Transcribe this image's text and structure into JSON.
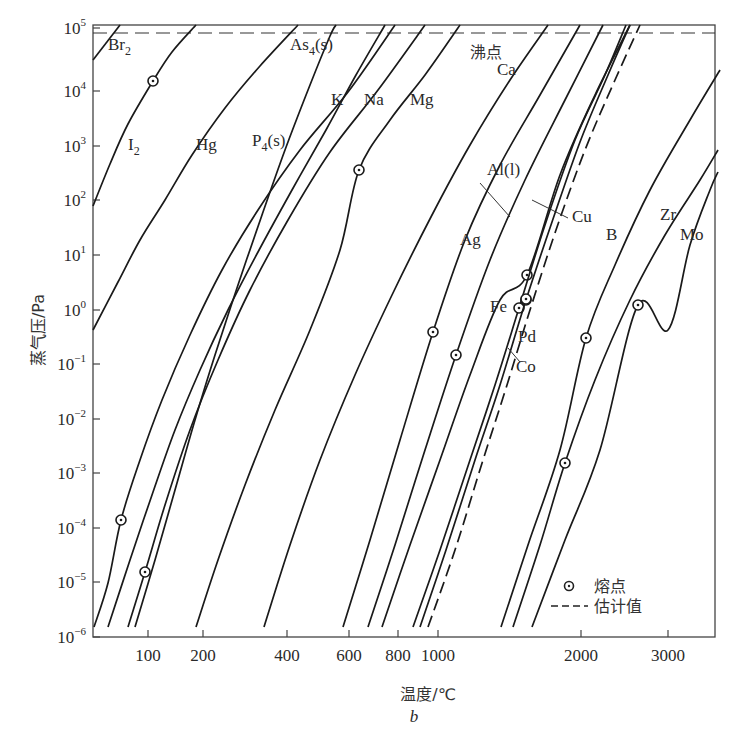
{
  "chart_data": {
    "type": "line",
    "title": "",
    "subtitle": "b",
    "xlabel": "温度/℃",
    "ylabel": "蒸气压/Pa",
    "x_scale": "reciprocal-temperature (1/T)",
    "y_scale": "log10",
    "ylim": [
      1e-06,
      100000.0
    ],
    "xlim_celsius": [
      30,
      3500
    ],
    "grid": false,
    "legend_position": "lower-right inside",
    "x_ticks": [
      {
        "label": "100",
        "value": 100,
        "px": 148
      },
      {
        "label": "200",
        "value": 200,
        "px": 203
      },
      {
        "label": "400",
        "value": 400,
        "px": 287
      },
      {
        "label": "600",
        "value": 600,
        "px": 349
      },
      {
        "label": "800",
        "value": 800,
        "px": 398
      },
      {
        "label": "1000",
        "value": 1000,
        "px": 438
      },
      {
        "label": "2000",
        "value": 2000,
        "px": 581
      },
      {
        "label": "3000",
        "value": 3000,
        "px": 668
      }
    ],
    "y_ticks": [
      {
        "base": "10",
        "exp": "5",
        "value": 100000,
        "px": 28
      },
      {
        "base": "10",
        "exp": "4",
        "value": 10000,
        "px": 91
      },
      {
        "base": "10",
        "exp": "3",
        "value": 1000,
        "px": 146
      },
      {
        "base": "10",
        "exp": "2",
        "value": 100,
        "px": 200
      },
      {
        "base": "10",
        "exp": "1",
        "value": 10,
        "px": 255
      },
      {
        "base": "10",
        "exp": "0",
        "value": 1,
        "px": 310
      },
      {
        "base": "10",
        "exp": "−1",
        "value": 0.1,
        "px": 364
      },
      {
        "base": "10",
        "exp": "−2",
        "value": 0.01,
        "px": 419
      },
      {
        "base": "10",
        "exp": "−3",
        "value": 0.001,
        "px": 473
      },
      {
        "base": "10",
        "exp": "−4",
        "value": 0.0001,
        "px": 528
      },
      {
        "base": "10",
        "exp": "−5",
        "value": 1e-05,
        "px": 582
      },
      {
        "base": "10",
        "exp": "−6",
        "value": 1e-06,
        "px": 637
      }
    ],
    "reference_lines": [
      {
        "name": "沸点",
        "meaning": "boiling point (1 atm)",
        "value_pa": 101325,
        "style": "dashed",
        "px_y": 33
      }
    ],
    "legend": [
      {
        "symbol": "circle-dot",
        "label": "熔点"
      },
      {
        "symbol": "dashed-line",
        "label": "估计值"
      }
    ],
    "series": [
      {
        "name": "Br₂",
        "label_display": "Br",
        "sub": "2",
        "style": "solid",
        "points": [
          [
            93,
            60
          ],
          [
            120,
            25
          ]
        ],
        "label_xy": [
          108,
          50
        ]
      },
      {
        "name": "I₂",
        "label_display": "I",
        "sub": "2",
        "style": "solid",
        "melting_point_px": [
          153,
          81
        ],
        "points": [
          [
            93,
            206
          ],
          [
            110,
            164
          ],
          [
            128,
            124
          ],
          [
            153,
            81
          ],
          [
            172,
            52
          ],
          [
            196,
            25
          ]
        ],
        "label_xy": [
          128,
          150
        ]
      },
      {
        "name": "Hg",
        "label_display": "Hg",
        "sub": "",
        "style": "solid",
        "points": [
          [
            93,
            330
          ],
          [
            118,
            282
          ],
          [
            140,
            240
          ],
          [
            165,
            200
          ],
          [
            192,
            155
          ],
          [
            225,
            108
          ],
          [
            260,
            66
          ],
          [
            298,
            25
          ]
        ],
        "label_xy": [
          196,
          150
        ]
      },
      {
        "name": "P₄(s)",
        "label_display": "P",
        "sub": "4",
        "suffix": "(s)",
        "style": "solid",
        "points": [
          [
            108,
            627
          ],
          [
            130,
            560
          ],
          [
            152,
            495
          ],
          [
            175,
            430
          ],
          [
            200,
            370
          ],
          [
            228,
            310
          ],
          [
            258,
            252
          ],
          [
            292,
            190
          ],
          [
            326,
            130
          ],
          [
            356,
            75
          ],
          [
            385,
            25
          ]
        ],
        "label_xy": [
          252,
          146
        ]
      },
      {
        "name": "As₄(s)",
        "label_display": "As",
        "sub": "4",
        "suffix": "(s)",
        "style": "solid",
        "points": [
          [
            135,
            627
          ],
          [
            155,
            560
          ],
          [
            175,
            490
          ],
          [
            195,
            420
          ],
          [
            215,
            355
          ],
          [
            238,
            285
          ],
          [
            262,
            215
          ],
          [
            285,
            150
          ],
          [
            310,
            85
          ],
          [
            330,
            36
          ],
          [
            336,
            25
          ]
        ],
        "label_xy": [
          290,
          50
        ]
      },
      {
        "name": "K",
        "label_display": "K",
        "sub": "",
        "style": "solid",
        "melting_point_px": [
          121,
          520
        ],
        "points": [
          [
            94,
            627
          ],
          [
            108,
            583
          ],
          [
            121,
            520
          ],
          [
            140,
            460
          ],
          [
            162,
            400
          ],
          [
            190,
            335
          ],
          [
            222,
            270
          ],
          [
            258,
            210
          ],
          [
            300,
            150
          ],
          [
            348,
            92
          ],
          [
            395,
            25
          ]
        ],
        "label_xy": [
          331,
          105
        ]
      },
      {
        "name": "Na",
        "label_display": "Na",
        "sub": "",
        "style": "solid",
        "melting_point_px": [
          145,
          572
        ],
        "points": [
          [
            128,
            627
          ],
          [
            145,
            572
          ],
          [
            165,
            505
          ],
          [
            190,
            430
          ],
          [
            218,
            360
          ],
          [
            250,
            290
          ],
          [
            288,
            220
          ],
          [
            330,
            152
          ],
          [
            378,
            90
          ],
          [
            425,
            25
          ]
        ],
        "label_xy": [
          364,
          105
        ]
      },
      {
        "name": "Mg",
        "label_display": "Mg",
        "sub": "",
        "style": "solid",
        "melting_point_px": [
          359,
          170
        ],
        "points": [
          [
            196,
            627
          ],
          [
            218,
            560
          ],
          [
            245,
            485
          ],
          [
            275,
            410
          ],
          [
            310,
            330
          ],
          [
            340,
            250
          ],
          [
            359,
            170
          ],
          [
            390,
            120
          ],
          [
            425,
            75
          ],
          [
            460,
            25
          ]
        ],
        "label_xy": [
          410,
          105
        ]
      },
      {
        "name": "Ca",
        "label_display": "Ca",
        "sub": "",
        "style": "solid",
        "points": [
          [
            264,
            627
          ],
          [
            290,
            545
          ],
          [
            320,
            460
          ],
          [
            355,
            375
          ],
          [
            392,
            295
          ],
          [
            432,
            215
          ],
          [
            470,
            145
          ],
          [
            510,
            80
          ],
          [
            548,
            25
          ]
        ],
        "label_xy": [
          497,
          75
        ]
      },
      {
        "name": "Ag",
        "label_display": "Ag",
        "sub": "",
        "style": "solid",
        "melting_point_px": [
          433,
          332
        ],
        "points": [
          [
            343,
            627
          ],
          [
            370,
            540
          ],
          [
            400,
            440
          ],
          [
            433,
            332
          ],
          [
            465,
            240
          ],
          [
            500,
            165
          ],
          [
            540,
            95
          ],
          [
            580,
            25
          ]
        ],
        "label_xy": [
          460,
          245
        ]
      },
      {
        "name": "Al(l)",
        "label_display": "Al(l)",
        "sub": "",
        "style": "solid",
        "melting_point_px": [
          456,
          355
        ],
        "points": [
          [
            368,
            627
          ],
          [
            395,
            545
          ],
          [
            425,
            450
          ],
          [
            456,
            355
          ],
          [
            490,
            260
          ],
          [
            525,
            180
          ],
          [
            565,
            100
          ],
          [
            603,
            25
          ]
        ],
        "label_xy": [
          487,
          175
        ],
        "leader": [
          [
            480,
            183
          ],
          [
            510,
            217
          ]
        ]
      },
      {
        "name": "Cu",
        "label_display": "Cu",
        "sub": "",
        "style": "solid",
        "melting_point_px": [
          527,
          275
        ],
        "points": [
          [
            382,
            627
          ],
          [
            410,
            545
          ],
          [
            440,
            460
          ],
          [
            470,
            375
          ],
          [
            500,
            300
          ],
          [
            527,
            275
          ],
          [
            560,
            175
          ],
          [
            595,
            95
          ],
          [
            630,
            25
          ]
        ],
        "label_xy": [
          572,
          222
        ],
        "leader": [
          [
            532,
            200
          ],
          [
            568,
            218
          ]
        ]
      },
      {
        "name": "Fe",
        "label_display": "Fe",
        "sub": "",
        "style": "solid",
        "melting_point_px": [
          519,
          308
        ],
        "points": [
          [
            413,
            627
          ],
          [
            440,
            550
          ],
          [
            470,
            460
          ],
          [
            495,
            385
          ],
          [
            519,
            308
          ],
          [
            545,
            225
          ],
          [
            575,
            140
          ],
          [
            605,
            75
          ],
          [
            626,
            25
          ]
        ],
        "label_xy": [
          490,
          312
        ]
      },
      {
        "name": "Pd",
        "label_display": "Pd",
        "sub": "",
        "style": "solid",
        "melting_point_px": [
          526,
          300
        ],
        "points": [
          [
            420,
            627
          ],
          [
            446,
            550
          ],
          [
            475,
            460
          ],
          [
            500,
            385
          ],
          [
            526,
            300
          ],
          [
            552,
            222
          ],
          [
            580,
            142
          ],
          [
            608,
            75
          ],
          [
            630,
            25
          ]
        ],
        "label_xy": [
          518,
          342
        ]
      },
      {
        "name": "Co",
        "label_display": "Co",
        "sub": "",
        "style": "dashed",
        "melting_point_px": [
          526,
          299
        ],
        "points": [
          [
            428,
            627
          ],
          [
            455,
            550
          ],
          [
            483,
            460
          ],
          [
            507,
            385
          ],
          [
            530,
            310
          ],
          [
            556,
            230
          ],
          [
            585,
            150
          ],
          [
            615,
            80
          ],
          [
            640,
            25
          ]
        ],
        "label_xy": [
          516,
          372
        ],
        "leader": [
          [
            508,
            348
          ],
          [
            520,
            362
          ]
        ]
      },
      {
        "name": "B",
        "label_display": "B",
        "sub": "",
        "style": "solid",
        "melting_point_px": [
          586,
          338
        ],
        "points": [
          [
            501,
            627
          ],
          [
            528,
            545
          ],
          [
            560,
            450
          ],
          [
            586,
            338
          ],
          [
            615,
            265
          ],
          [
            650,
            190
          ],
          [
            690,
            120
          ],
          [
            720,
            70
          ]
        ],
        "label_xy": [
          606,
          240
        ]
      },
      {
        "name": "Zr",
        "label_display": "Zr",
        "sub": "",
        "style": "solid",
        "melting_point_px": [
          565,
          463
        ],
        "points": [
          [
            513,
            627
          ],
          [
            540,
            545
          ],
          [
            565,
            463
          ],
          [
            595,
            380
          ],
          [
            630,
            300
          ],
          [
            665,
            235
          ],
          [
            700,
            180
          ],
          [
            718,
            150
          ]
        ],
        "label_xy": [
          660,
          220
        ]
      },
      {
        "name": "Mo",
        "label_display": "Mo",
        "sub": "",
        "style": "solid",
        "melting_point_px": [
          638,
          305
        ],
        "points": [
          [
            532,
            627
          ],
          [
            565,
            540
          ],
          [
            600,
            450
          ],
          [
            638,
            305
          ],
          [
            668,
            330
          ],
          [
            690,
            245
          ],
          [
            710,
            190
          ],
          [
            718,
            172
          ]
        ],
        "label_xy": [
          680,
          240
        ]
      }
    ]
  },
  "text": {
    "boiling_label": "沸点",
    "ylabel": "蒸气压/Pa",
    "xlabel": "温度/℃",
    "subtitle": "b",
    "legend_melting": "熔点",
    "legend_estimated": "估计值"
  }
}
